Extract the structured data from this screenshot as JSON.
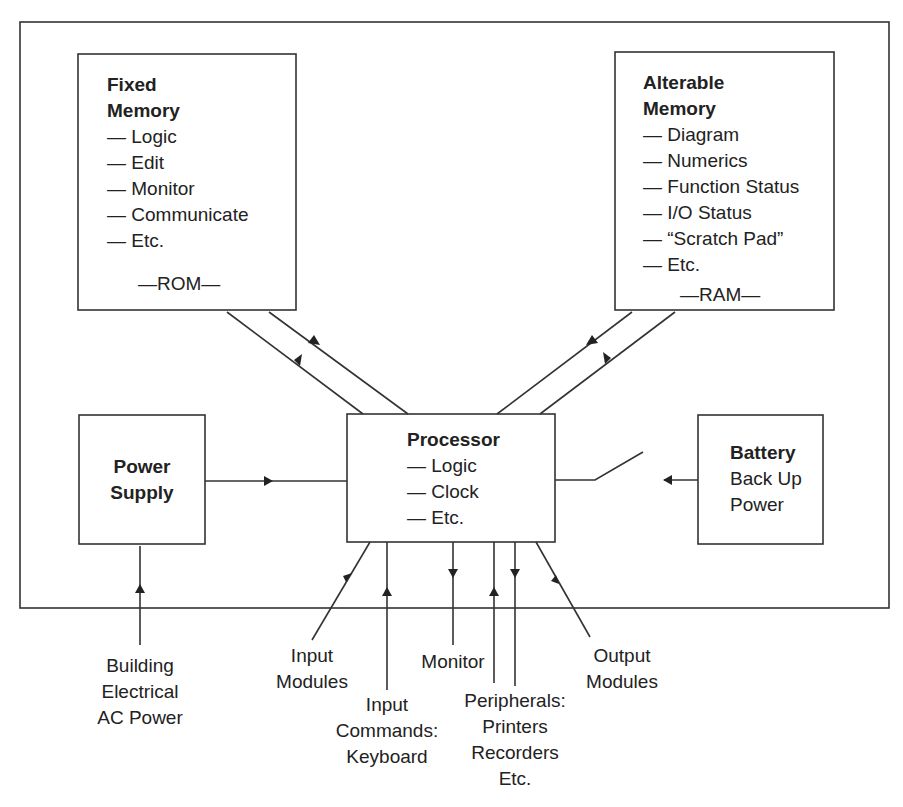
{
  "diagram": {
    "title": "",
    "blocks": {
      "fixed_memory": {
        "title_line1": "Fixed",
        "title_line2": "Memory",
        "items": [
          "— Logic",
          "— Edit",
          "— Monitor",
          "— Communicate",
          "— Etc."
        ],
        "footer": "—ROM—"
      },
      "alterable_memory": {
        "title_line1": "Alterable",
        "title_line2": "Memory",
        "items": [
          "— Diagram",
          "— Numerics",
          "— Function Status",
          "— I/O Status",
          "— “Scratch Pad”",
          "— Etc."
        ],
        "footer": "—RAM—"
      },
      "processor": {
        "title": "Processor",
        "items": [
          "— Logic",
          "— Clock",
          "— Etc."
        ]
      },
      "power_supply": {
        "title_line1": "Power",
        "title_line2": "Supply"
      },
      "battery": {
        "title": "Battery",
        "line1": "Back Up",
        "line2": "Power"
      }
    },
    "external_labels": {
      "building_power": [
        "Building",
        "Electrical",
        "AC Power"
      ],
      "input_modules": [
        "Input",
        "Modules"
      ],
      "input_commands": [
        "Input",
        "Commands:",
        "Keyboard"
      ],
      "monitor": [
        "Monitor"
      ],
      "peripherals": [
        "Peripherals:",
        "Printers",
        "Recorders",
        "Etc."
      ],
      "output_modules": [
        "Output",
        "Modules"
      ]
    },
    "colors": {
      "line": "#333333",
      "text": "#222222",
      "background": "#ffffff"
    }
  }
}
